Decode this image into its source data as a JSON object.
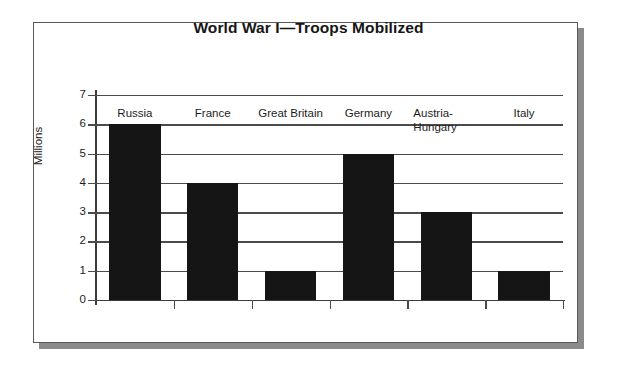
{
  "chart_data": {
    "type": "bar",
    "title": "World War I—Troops Mobilized",
    "xlabel": "",
    "ylabel": "Millions",
    "categories": [
      "Russia",
      "France",
      "Great Britain",
      "Germany",
      "Austria-Hungary",
      "Italy"
    ],
    "values": [
      6,
      4,
      1,
      5,
      3,
      1
    ],
    "ylim": [
      0,
      7
    ],
    "yticks": [
      0,
      1,
      2,
      3,
      4,
      5,
      6,
      7
    ],
    "ytick_labels": [
      "0",
      "1",
      "2",
      "3",
      "4",
      "5",
      "6",
      "7"
    ],
    "grid": true,
    "grid_axis": "y",
    "legend": false,
    "bar_color": "#151515",
    "grid_color": "#4b4b4e",
    "text_color": "#1d1d1d",
    "background": "#ffffff",
    "series": [
      {
        "name": "Troops Mobilized",
        "values": [
          6,
          4,
          1,
          5,
          3,
          1
        ]
      }
    ]
  },
  "figure": {
    "frame_color": "#59595c",
    "shadow_color": "#8a8a8a"
  }
}
